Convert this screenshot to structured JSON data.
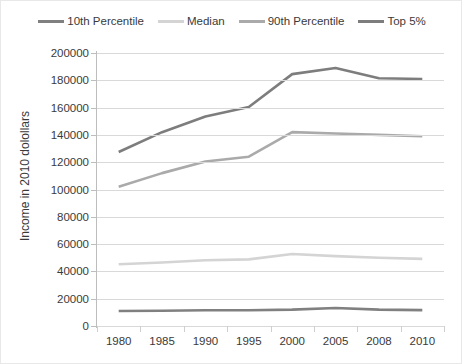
{
  "chart_data": {
    "type": "line",
    "title": "",
    "xlabel": "",
    "ylabel": "Income in 2010 dolollars",
    "categories": [
      "1980",
      "1985",
      "1990",
      "1995",
      "2000",
      "2005",
      "2008",
      "2010"
    ],
    "ylim": [
      0,
      200000
    ],
    "ytick_labels": [
      "200000",
      "180000",
      "160000",
      "140000",
      "120000",
      "100000",
      "80000",
      "60000",
      "40000",
      "20000",
      "0"
    ],
    "ytick_values": [
      200000,
      180000,
      160000,
      140000,
      120000,
      100000,
      80000,
      60000,
      40000,
      20000,
      0
    ],
    "grid": true,
    "legend_position": "top",
    "series": [
      {
        "name": "10th Percentile",
        "color": "#808080",
        "values": [
          11000,
          11200,
          11500,
          11500,
          12000,
          13200,
          12000,
          11600
        ]
      },
      {
        "name": "Median",
        "color": "#d4d4d4",
        "values": [
          45200,
          46500,
          48200,
          48800,
          52800,
          51200,
          50000,
          49200
        ]
      },
      {
        "name": "90th Percentile",
        "color": "#aaaaaa",
        "values": [
          102000,
          112000,
          120500,
          124000,
          142000,
          141000,
          140000,
          139000
        ]
      },
      {
        "name": "Top 5%",
        "color": "#7d7d7d",
        "values": [
          127500,
          142000,
          153500,
          160500,
          184500,
          189000,
          181500,
          181000
        ]
      }
    ]
  },
  "legend": {
    "entries": [
      {
        "label": "10th Percentile",
        "color": "#808080"
      },
      {
        "label": "Median",
        "color": "#d4d4d4"
      },
      {
        "label": "90th Percentile",
        "color": "#aaaaaa"
      },
      {
        "label": "Top 5%",
        "color": "#7d7d7d"
      }
    ]
  },
  "axes": {
    "y_title": "Income in 2010 dolollars",
    "gridline_color": "#d9d9d9",
    "axis_color": "#bdbdbd"
  }
}
